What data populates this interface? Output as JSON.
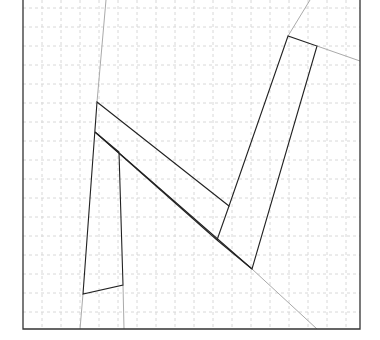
{
  "diagram": {
    "width": 380,
    "height": 340,
    "frame": {
      "left": 23,
      "right": 360,
      "top": 0,
      "bottom": 329,
      "color": "#333333"
    },
    "grid": {
      "spacing": 19,
      "origin_x": 23,
      "origin_y": 8,
      "color": "#d8d8d8"
    },
    "colors": {
      "shape": "#222222",
      "extension": "#aaaaaa"
    },
    "extension_lines": [
      {
        "x1": 106,
        "y1": 0,
        "x2": 97,
        "y2": 102
      },
      {
        "x1": 83,
        "y1": 294,
        "x2": 80,
        "y2": 329
      },
      {
        "x1": 123,
        "y1": 285,
        "x2": 124,
        "y2": 329
      },
      {
        "x1": 310,
        "y1": 0,
        "x2": 288,
        "y2": 36
      },
      {
        "x1": 317,
        "y1": 46,
        "x2": 360,
        "y2": 61
      },
      {
        "x1": 252,
        "y1": 269,
        "x2": 317,
        "y2": 329
      }
    ],
    "shape_polygon": [
      [
        97,
        102
      ],
      [
        229,
        206
      ],
      [
        288,
        36
      ],
      [
        317,
        46
      ],
      [
        252,
        269
      ],
      [
        95,
        132
      ],
      [
        119,
        152
      ],
      [
        123,
        285
      ],
      [
        83,
        294
      ]
    ],
    "inner_segments": [
      {
        "x1": 95,
        "y1": 132,
        "x2": 217,
        "y2": 240
      },
      {
        "x1": 217,
        "y1": 240,
        "x2": 229,
        "y2": 206
      },
      {
        "x1": 217,
        "y1": 240,
        "x2": 252,
        "y2": 269
      }
    ]
  }
}
